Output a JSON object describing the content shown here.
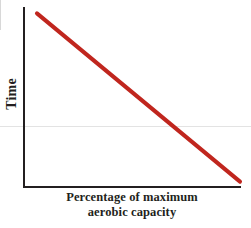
{
  "chart_data": {
    "type": "line",
    "title": "",
    "subtitle": "",
    "xlabel": "Percentage of maximum aerobic capacity",
    "xlabel_line1": "Percentage of maximum",
    "xlabel_line2": "aerobic capacity",
    "ylabel": "Time",
    "grid": false,
    "legend": "none",
    "x_tick_labels": [],
    "y_tick_labels": [],
    "xlim": [
      0,
      100
    ],
    "ylim": [
      0,
      100
    ],
    "annotations": [],
    "series": [
      {
        "name": "Time vs percentage of maximum aerobic capacity",
        "color": "#C0261E",
        "line_width_px": 4,
        "x": [
          6,
          100
        ],
        "y": [
          97,
          3
        ],
        "relationship": "negative linear",
        "description": "Straight descending line: time to exhaustion decreases linearly as percentage of maximum aerobic capacity increases"
      }
    ]
  },
  "axes": {
    "axis_color": "#231f20",
    "axis_line_width_px": 2,
    "y_axis_top_px": 8,
    "y_axis_bottom_px": 187,
    "x_axis_left_px": 24,
    "x_axis_right_px": 240
  },
  "colors": {
    "background": "#ffffff",
    "line": "#C0261E",
    "axis": "#231f20",
    "text": "#231f20",
    "artifact": "#e3e3e3"
  }
}
